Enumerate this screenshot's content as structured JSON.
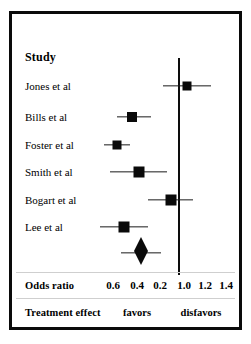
{
  "chart_data": {
    "type": "scatter",
    "plot_kind": "forest-plot",
    "title": "",
    "xlabel": "Odds ratio",
    "ylabel": "Study",
    "column_headers": {
      "study": "Study",
      "odds_ratio": "Odds ratio",
      "treatment_effect": "Treatment effect"
    },
    "axis": {
      "tick_labels": [
        "0.6",
        "0.4",
        "0.2",
        "1.0",
        "1.2",
        "1.4"
      ],
      "tick_x_px": [
        113,
        137,
        160,
        184,
        205,
        226
      ],
      "null_value_label": "1.0",
      "null_line_x_px": 171,
      "grid": false
    },
    "direction_labels": {
      "left": "favors",
      "right": "disfavors",
      "left_x_px": 137,
      "right_x_px": 201
    },
    "categories": [
      "Jones et al",
      "Bills et al",
      "Foster et al",
      "Smith et al",
      "Bogart et al",
      "Lee et al"
    ],
    "rows": [
      {
        "study": "Jones et al",
        "row_y_px": 86,
        "point_x_px": 187,
        "ci_low_x_px": 163,
        "ci_high_x_px": 211,
        "box_size_px": 9
      },
      {
        "study": "Bills et al",
        "row_y_px": 117,
        "point_x_px": 132,
        "ci_low_x_px": 117,
        "ci_high_x_px": 151,
        "box_size_px": 10
      },
      {
        "study": "Foster et al",
        "row_y_px": 145,
        "point_x_px": 117,
        "ci_low_x_px": 104,
        "ci_high_x_px": 130,
        "box_size_px": 9
      },
      {
        "study": "Smith et al",
        "row_y_px": 172,
        "point_x_px": 139,
        "ci_low_x_px": 110,
        "ci_high_x_px": 167,
        "box_size_px": 11
      },
      {
        "study": "Bogart et al",
        "row_y_px": 200,
        "point_x_px": 171,
        "ci_low_x_px": 148,
        "ci_high_x_px": 193,
        "box_size_px": 11
      },
      {
        "study": "Lee et al",
        "row_y_px": 227,
        "point_x_px": 124,
        "ci_low_x_px": 100,
        "ci_high_x_px": 148,
        "box_size_px": 11
      }
    ],
    "summary": {
      "label": "",
      "row_y_px": 253,
      "point_x_px": 141,
      "ci_low_x_px": 121,
      "ci_high_x_px": 161,
      "diamond_half_width_px": 7,
      "diamond_half_height_px": 13
    },
    "colors": {
      "marker": "#0a0a0a",
      "line": "#1a1a1a",
      "frame": "#0a0a0a",
      "background": "#ffffff",
      "rule": "#cfcfcf"
    },
    "geometry": {
      "null_line_top_px": 55,
      "null_line_bottom_px": 272,
      "axis_row_y_px": 285,
      "footer_row_y_px": 312,
      "rule_top_y_px": 272,
      "rule_bottom_y_px": 298
    }
  }
}
